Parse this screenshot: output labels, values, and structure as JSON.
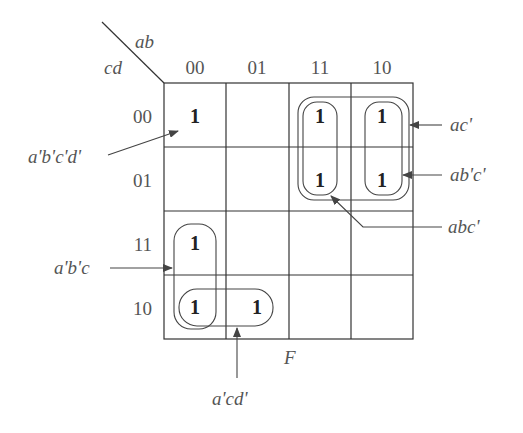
{
  "diagram": {
    "type": "karnaugh-map",
    "function_name": "F",
    "row_variable_label": "cd",
    "column_variable_label": "ab",
    "column_headers": [
      "00",
      "01",
      "11",
      "10"
    ],
    "row_headers": [
      "00",
      "01",
      "11",
      "10"
    ],
    "cells": [
      [
        "1",
        "",
        "1",
        "1"
      ],
      [
        "",
        "",
        "1",
        "1"
      ],
      [
        "1",
        "",
        "",
        ""
      ],
      [
        "1",
        "1",
        "",
        ""
      ]
    ],
    "groups": [
      {
        "term": "a'b'c'd'",
        "cells": [
          [
            0,
            0
          ]
        ]
      },
      {
        "term": "ac'",
        "cells": [
          [
            0,
            2
          ],
          [
            0,
            3
          ],
          [
            1,
            2
          ],
          [
            1,
            3
          ]
        ]
      },
      {
        "term": "ab'c'",
        "cells": [
          [
            0,
            3
          ],
          [
            1,
            3
          ]
        ]
      },
      {
        "term": "abc'",
        "cells": [
          [
            0,
            2
          ],
          [
            1,
            2
          ]
        ]
      },
      {
        "term": "a'b'c",
        "cells": [
          [
            2,
            0
          ],
          [
            3,
            0
          ]
        ]
      },
      {
        "term": "a'cd'",
        "cells": [
          [
            3,
            0
          ],
          [
            3,
            1
          ]
        ]
      }
    ]
  }
}
